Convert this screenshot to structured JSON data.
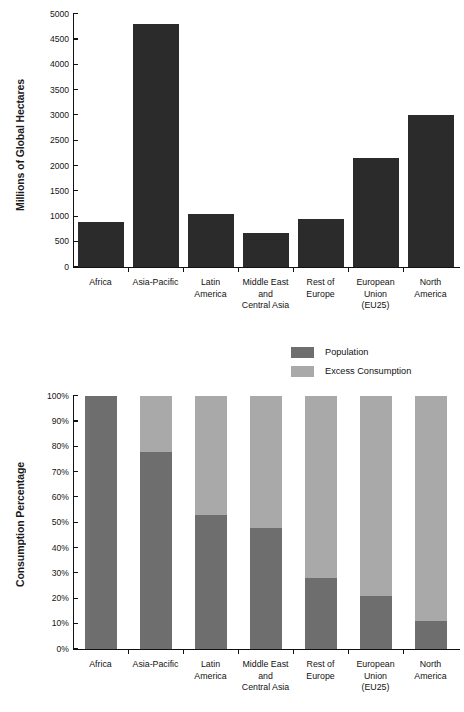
{
  "legend": {
    "items": [
      {
        "label": "Population",
        "color": "#6e6e6e",
        "key": "population"
      },
      {
        "label": "Excess Consumption",
        "color": "#a9a9a9",
        "key": "excess"
      }
    ]
  },
  "chart_data": [
    {
      "id": "ecological-footprint-bar",
      "type": "bar",
      "title": "",
      "xlabel": "",
      "ylabel": "Millions of Global Hectares",
      "ylim": [
        0,
        5000
      ],
      "ytick_step": 500,
      "grid": false,
      "bar_color": "#2b2b2b",
      "categories": [
        "Africa",
        "Asia-Pacific",
        "Latin America",
        "Middle East and Central Asia",
        "Rest of Europe",
        "European Union (EU25)",
        "North America"
      ],
      "category_lines": [
        [
          "Africa"
        ],
        [
          "Asia-Pacific"
        ],
        [
          "Latin",
          "America"
        ],
        [
          "Middle East",
          "and",
          "Central Asia"
        ],
        [
          "Rest of",
          "Europe"
        ],
        [
          "European",
          "Union",
          "(EU25)"
        ],
        [
          "North",
          "America"
        ]
      ],
      "ticklabels": [
        "0",
        "500",
        "1000",
        "1500",
        "2000",
        "2500",
        "3000",
        "3500",
        "4000",
        "4500",
        "5000"
      ],
      "values": [
        890,
        4800,
        1050,
        670,
        950,
        2150,
        3000
      ]
    },
    {
      "id": "consumption-percentage-stacked",
      "type": "bar",
      "stacked": true,
      "stack_mode": "percent",
      "title": "",
      "xlabel": "",
      "ylabel": "Consumption Percentage",
      "ylim": [
        0,
        100
      ],
      "ytick_step": 10,
      "grid": false,
      "categories": [
        "Africa",
        "Asia-Pacific",
        "Latin America",
        "Middle East and Central Asia",
        "Rest of Europe",
        "European Union (EU25)",
        "North America"
      ],
      "category_lines": [
        [
          "Africa"
        ],
        [
          "Asia-Pacific"
        ],
        [
          "Latin",
          "America"
        ],
        [
          "Middle East",
          "and",
          "Central Asia"
        ],
        [
          "Rest of",
          "Europe"
        ],
        [
          "European",
          "Union",
          "(EU25)"
        ],
        [
          "North",
          "America"
        ]
      ],
      "ticklabels": [
        "0%",
        "10%",
        "20%",
        "30%",
        "40%",
        "50%",
        "60%",
        "70%",
        "80%",
        "90%",
        "100%"
      ],
      "legend_position": "above-plot-center-right",
      "series": [
        {
          "name": "Population",
          "color": "#6e6e6e",
          "values": [
            100,
            78,
            53,
            48,
            28,
            21,
            11
          ]
        },
        {
          "name": "Excess Consumption",
          "color": "#a9a9a9",
          "values": [
            0,
            22,
            47,
            52,
            72,
            79,
            89
          ]
        }
      ]
    }
  ]
}
